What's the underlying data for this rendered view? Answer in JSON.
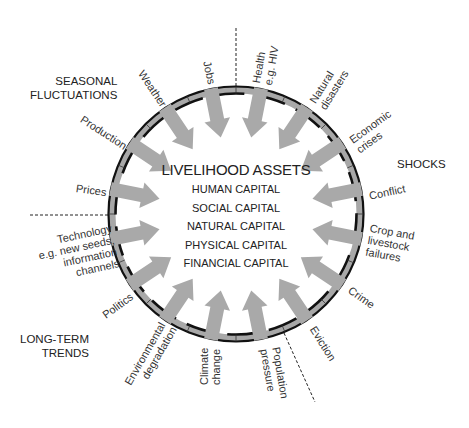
{
  "center": {
    "title": "LIVELIHOOD ASSETS",
    "capitals": [
      "HUMAN CAPITAL",
      "SOCIAL CAPITAL",
      "NATURAL CAPITAL",
      "PHYSICAL CAPITAL",
      "FINANCIAL CAPITAL"
    ]
  },
  "groups": {
    "seasonal": [
      "SEASONAL",
      "FLUCTUATIONS"
    ],
    "shocks": "SHOCKS",
    "trends": [
      "LONG-TERM",
      "TRENDS"
    ]
  },
  "factors": [
    {
      "id": "health",
      "lines": [
        "Health",
        "e.g. HIV"
      ],
      "group": "shocks"
    },
    {
      "id": "natural-disasters",
      "lines": [
        "Natural",
        "disasters"
      ],
      "group": "shocks"
    },
    {
      "id": "economic-crises",
      "lines": [
        "Economic",
        "crises"
      ],
      "group": "shocks"
    },
    {
      "id": "conflict",
      "lines": [
        "Conflict"
      ],
      "group": "shocks"
    },
    {
      "id": "crop-livestock",
      "lines": [
        "Crop and",
        "livestock",
        "failures"
      ],
      "group": "shocks"
    },
    {
      "id": "crime",
      "lines": [
        "Crime"
      ],
      "group": "shocks"
    },
    {
      "id": "eviction",
      "lines": [
        "Eviction"
      ],
      "group": "shocks"
    },
    {
      "id": "population",
      "lines": [
        "Population",
        "pressure"
      ],
      "group": "trends"
    },
    {
      "id": "climate",
      "lines": [
        "Climate",
        "change"
      ],
      "group": "trends"
    },
    {
      "id": "environment",
      "lines": [
        "Environmental",
        "degradation"
      ],
      "group": "trends"
    },
    {
      "id": "politics",
      "lines": [
        "Politics"
      ],
      "group": "trends"
    },
    {
      "id": "technology",
      "lines": [
        "Technology",
        "e.g. new seeds,",
        "information",
        "channels"
      ],
      "group": "trends"
    },
    {
      "id": "prices",
      "lines": [
        "Prices"
      ],
      "group": "seasonal"
    },
    {
      "id": "production",
      "lines": [
        "Production"
      ],
      "group": "seasonal"
    },
    {
      "id": "weather",
      "lines": [
        "Weather"
      ],
      "group": "seasonal"
    },
    {
      "id": "jobs",
      "lines": [
        "Jobs"
      ],
      "group": "seasonal"
    }
  ],
  "colors": {
    "ring_band": "#a8a8a8",
    "ring_line": "#111111",
    "arrow": "#a9a9a9",
    "text": "#222222"
  }
}
